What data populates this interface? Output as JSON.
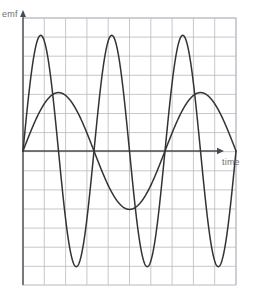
{
  "figure": {
    "name": "emf-versus-time-graph",
    "background_color": "#ffffff",
    "grid_color": "#b9b9c2",
    "axis_color": "#4a4a4f",
    "curve_color": "#333333",
    "label_color": "#6f6f73"
  },
  "axes": {
    "ylabel": "emf",
    "xlabel": "time",
    "origin_x": 23,
    "origin_y": 151,
    "grid_left": 23,
    "grid_right": 236,
    "grid_top": 18,
    "grid_bottom": 285,
    "grid_step_x": 21.3,
    "grid_step_y": 19.1,
    "y_arrow_top": 14,
    "x_arrow_right": 219
  },
  "chart_data": {
    "type": "line",
    "title": "",
    "xlabel": "time",
    "ylabel": "emf",
    "grid": true,
    "legend": "none",
    "x_tick_labels": [],
    "y_tick_labels": [],
    "xlim": [
      0,
      9.0
    ],
    "ylim": [
      -1.15,
      1.15
    ],
    "series": [
      {
        "name": "large-fast-wave",
        "waveform": "sine",
        "amplitude": 1.0,
        "period": 3.0,
        "phase_deg": 0,
        "cycles": 3,
        "x_start": 0,
        "x_end": 9.0,
        "description": "high amplitude sinusoid, three complete cycles, starts at zero rising",
        "x": [
          0,
          0.375,
          0.75,
          1.125,
          1.5,
          1.875,
          2.25,
          2.625,
          3.0,
          3.375,
          3.75,
          4.125,
          4.5,
          4.875,
          5.25,
          5.625,
          6.0,
          6.375,
          6.75,
          7.125,
          7.5,
          7.875,
          8.25,
          8.625,
          9.0
        ],
        "y": [
          0,
          0.707,
          1.0,
          0.707,
          0,
          -0.707,
          -1.0,
          -0.707,
          0,
          0.707,
          1.0,
          0.707,
          0,
          -0.707,
          -1.0,
          -0.707,
          0,
          0.707,
          1.0,
          0.707,
          0,
          -0.707,
          -1.0,
          -0.707,
          0
        ]
      },
      {
        "name": "small-slow-wave",
        "waveform": "sine",
        "amplitude": 0.505,
        "period": 6.0,
        "phase_deg": 0,
        "cycles": 1.5,
        "x_start": 0,
        "x_end": 9.0,
        "description": "lower amplitude sinusoid, half the frequency, one and a half cycles",
        "x": [
          0,
          0.75,
          1.5,
          2.25,
          3.0,
          3.75,
          4.5,
          5.25,
          6.0,
          6.75,
          7.5,
          8.25,
          9.0
        ],
        "y": [
          0,
          0.357,
          0.505,
          0.357,
          0,
          -0.357,
          -0.505,
          -0.357,
          0,
          0.357,
          0.505,
          0.357,
          0
        ]
      }
    ],
    "annotations": [
      {
        "name": "y-axis-arrow",
        "text": "emf"
      },
      {
        "name": "x-axis-arrow",
        "text": "time"
      }
    ]
  }
}
